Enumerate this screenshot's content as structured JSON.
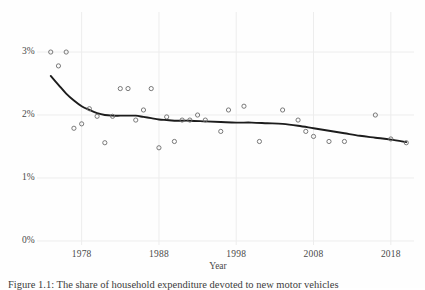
{
  "figure": {
    "caption": "Figure 1.1: The share of household expenditure devoted to new motor vehicles"
  },
  "chart_data": {
    "type": "scatter",
    "title": "",
    "subtitle": "",
    "xlabel": "Year",
    "ylabel": "",
    "xlim": [
      1973,
      2021
    ],
    "ylim": [
      0,
      3.35
    ],
    "grid": true,
    "legend": null,
    "x_tick_labels": [
      "1978",
      "1988",
      "1998",
      "2008",
      "2018"
    ],
    "x_tick_values": [
      1978,
      1988,
      1998,
      2008,
      2018
    ],
    "y_tick_labels": [
      "0%",
      "1%",
      "2%",
      "3%"
    ],
    "y_tick_values": [
      0,
      1,
      2,
      3
    ],
    "y_unit": "%",
    "marker": "open-circle",
    "marker_color": "#6b6b6b",
    "line_color": "#1c1c1c",
    "grid_color": "#ededed",
    "background_color": "#fefefe",
    "series": [
      {
        "name": "Observed share",
        "type": "scatter",
        "points": [
          {
            "x": 1974,
            "y": 3.0
          },
          {
            "x": 1975,
            "y": 2.78
          },
          {
            "x": 1976,
            "y": 3.0
          },
          {
            "x": 1977,
            "y": 1.79
          },
          {
            "x": 1978,
            "y": 1.86
          },
          {
            "x": 1979,
            "y": 2.1
          },
          {
            "x": 1980,
            "y": 1.98
          },
          {
            "x": 1981,
            "y": 1.56
          },
          {
            "x": 1982,
            "y": 1.98
          },
          {
            "x": 1983,
            "y": 2.42
          },
          {
            "x": 1984,
            "y": 2.42
          },
          {
            "x": 1985,
            "y": 1.92
          },
          {
            "x": 1986,
            "y": 2.08
          },
          {
            "x": 1987,
            "y": 2.42
          },
          {
            "x": 1988,
            "y": 1.48
          },
          {
            "x": 1989,
            "y": 1.97
          },
          {
            "x": 1990,
            "y": 1.58
          },
          {
            "x": 1991,
            "y": 1.92
          },
          {
            "x": 1992,
            "y": 1.92
          },
          {
            "x": 1993,
            "y": 2.0
          },
          {
            "x": 1994,
            "y": 1.92
          },
          {
            "x": 1996,
            "y": 1.74
          },
          {
            "x": 1997,
            "y": 2.08
          },
          {
            "x": 1999,
            "y": 2.14
          },
          {
            "x": 2001,
            "y": 1.58
          },
          {
            "x": 2004,
            "y": 2.08
          },
          {
            "x": 2006,
            "y": 1.92
          },
          {
            "x": 2007,
            "y": 1.74
          },
          {
            "x": 2008,
            "y": 1.66
          },
          {
            "x": 2010,
            "y": 1.58
          },
          {
            "x": 2012,
            "y": 1.58
          },
          {
            "x": 2016,
            "y": 2.0
          },
          {
            "x": 2018,
            "y": 1.62
          },
          {
            "x": 2020,
            "y": 1.56
          }
        ]
      },
      {
        "name": "Smoothed trend",
        "type": "line",
        "points": [
          {
            "x": 1974,
            "y": 2.62
          },
          {
            "x": 1975,
            "y": 2.48
          },
          {
            "x": 1976,
            "y": 2.34
          },
          {
            "x": 1977,
            "y": 2.23
          },
          {
            "x": 1978,
            "y": 2.14
          },
          {
            "x": 1979,
            "y": 2.08
          },
          {
            "x": 1980,
            "y": 2.03
          },
          {
            "x": 1981,
            "y": 2.0
          },
          {
            "x": 1982,
            "y": 1.99
          },
          {
            "x": 1983,
            "y": 1.99
          },
          {
            "x": 1984,
            "y": 1.99
          },
          {
            "x": 1985,
            "y": 1.99
          },
          {
            "x": 1986,
            "y": 1.97
          },
          {
            "x": 1987,
            "y": 1.95
          },
          {
            "x": 1988,
            "y": 1.93
          },
          {
            "x": 1989,
            "y": 1.92
          },
          {
            "x": 1990,
            "y": 1.91
          },
          {
            "x": 1992,
            "y": 1.91
          },
          {
            "x": 1994,
            "y": 1.9
          },
          {
            "x": 1996,
            "y": 1.89
          },
          {
            "x": 1998,
            "y": 1.88
          },
          {
            "x": 2000,
            "y": 1.88
          },
          {
            "x": 2002,
            "y": 1.87
          },
          {
            "x": 2004,
            "y": 1.86
          },
          {
            "x": 2006,
            "y": 1.83
          },
          {
            "x": 2008,
            "y": 1.79
          },
          {
            "x": 2010,
            "y": 1.75
          },
          {
            "x": 2012,
            "y": 1.71
          },
          {
            "x": 2014,
            "y": 1.67
          },
          {
            "x": 2016,
            "y": 1.64
          },
          {
            "x": 2018,
            "y": 1.61
          },
          {
            "x": 2020,
            "y": 1.57
          }
        ]
      }
    ]
  }
}
